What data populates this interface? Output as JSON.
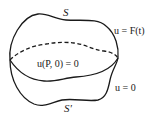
{
  "diagram": {
    "labels": {
      "top_surface": "S",
      "bottom_surface": "S'",
      "top_condition": "u = F(t)",
      "initial_condition": "u(P, 0) = 0",
      "bottom_condition": "u = 0"
    },
    "colors": {
      "stroke": "#1a1a1a",
      "background": "#ffffff"
    },
    "curves": [
      {
        "name": "surface-S",
        "style": "solid"
      },
      {
        "name": "hidden-edge",
        "style": "dashed"
      },
      {
        "name": "middle-edge",
        "style": "solid"
      },
      {
        "name": "surface-S-prime",
        "style": "solid"
      }
    ]
  }
}
